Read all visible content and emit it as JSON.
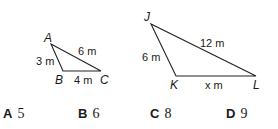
{
  "figures": {
    "triangle_abc": {
      "vertices": {
        "A": "A",
        "B": "B",
        "C": "C"
      },
      "sides": {
        "AB": "3 m",
        "AC": "6 m",
        "BC": "4 m"
      }
    },
    "triangle_jkl": {
      "vertices": {
        "J": "J",
        "K": "K",
        "L": "L"
      },
      "sides": {
        "JK": "6 m",
        "JL": "12 m",
        "KL": "x m"
      }
    }
  },
  "choices": [
    {
      "letter": "A",
      "value": "5"
    },
    {
      "letter": "B",
      "value": "6"
    },
    {
      "letter": "C",
      "value": "8"
    },
    {
      "letter": "D",
      "value": "9"
    }
  ]
}
